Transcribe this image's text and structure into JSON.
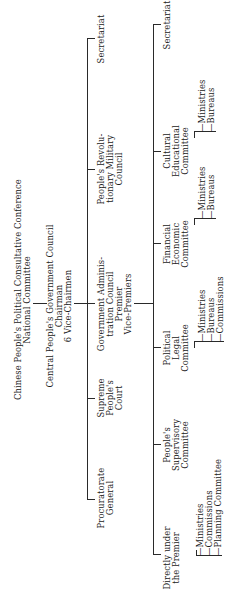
{
  "chart": {
    "top": {
      "line1": "Chinese People's Political Consultative Conference",
      "line2": "National Committee"
    },
    "council": {
      "line1": "Central People's Government Council",
      "line2": "Chairman",
      "line3": "6 Vice-Chairmen"
    },
    "level2": [
      {
        "lines": [
          "Procuratorate",
          "General"
        ]
      },
      {
        "lines": [
          "Supreme",
          "People's",
          "Court"
        ]
      },
      {
        "lines": [
          "Government Adminis-",
          "tration Council",
          "Premier",
          "Vice-Premiers"
        ]
      },
      {
        "lines": [
          "People's Revolu-",
          "tionary Military",
          "Council"
        ]
      },
      {
        "lines": [
          "Secretariat"
        ]
      }
    ],
    "level3": [
      {
        "lines": [
          "Directly under",
          "the Premier"
        ],
        "subs": [
          "Ministries",
          "Commissions",
          "Planning Committee"
        ]
      },
      {
        "lines": [
          "People's",
          "Supervisory",
          "Committee"
        ],
        "subs": []
      },
      {
        "lines": [
          "Political",
          "Legal",
          "Committee"
        ],
        "subs": [
          "Ministries",
          "Bureaus",
          "Commissions"
        ]
      },
      {
        "lines": [
          "Financial",
          "Economic",
          "Committee"
        ],
        "subs": [
          "Ministries",
          "Bureaus"
        ]
      },
      {
        "lines": [
          "Cultural",
          "Educational",
          "Committee"
        ],
        "subs": [
          "Ministries",
          "Bureaus"
        ]
      },
      {
        "lines": [
          "Secretariat"
        ],
        "subs": []
      }
    ]
  }
}
